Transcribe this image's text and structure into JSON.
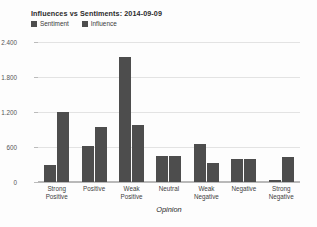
{
  "chart_data": {
    "type": "bar",
    "title": "Influences vs Sentiments: 2014-09-09",
    "xlabel": "Opinion",
    "ylabel": "",
    "categories": [
      "Strong Positive",
      "Positive",
      "Weak Positive",
      "Neutral",
      "Weak Negative",
      "Negative",
      "Strong Negative"
    ],
    "series": [
      {
        "name": "Sentiment",
        "color": "#4d4d4d",
        "values": [
          290,
          620,
          2140,
          450,
          650,
          390,
          35
        ]
      },
      {
        "name": "Influence",
        "color": "#4d4d4d",
        "values": [
          1200,
          950,
          980,
          450,
          330,
          390,
          430
        ]
      }
    ],
    "ylim": [
      0,
      2400
    ],
    "yticks": [
      2400,
      1800,
      1200,
      600,
      0
    ],
    "ytick_labels": [
      "2.400",
      "1.800",
      "1.200",
      "600",
      "0"
    ],
    "grid": true,
    "legend_position": "top-left"
  },
  "axis": {
    "x_title": "Opinion"
  },
  "xlabels": [
    {
      "line1": "Strong",
      "line2": "Positive"
    },
    {
      "line1": "Positive",
      "line2": ""
    },
    {
      "line1": "Weak",
      "line2": "Positive"
    },
    {
      "line1": "Neutral",
      "line2": ""
    },
    {
      "line1": "Weak",
      "line2": "Negative"
    },
    {
      "line1": "Negative",
      "line2": ""
    },
    {
      "line1": "Strong",
      "line2": "Negative"
    }
  ],
  "colors": {
    "bar": "#4d4d4d",
    "grid": "#e3e3e3",
    "axis": "#b9b9b9",
    "background": "#fdfdfd",
    "text": "#2b2b2b"
  }
}
